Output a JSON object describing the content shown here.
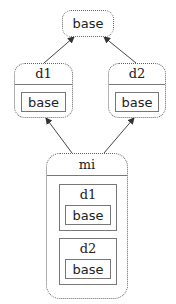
{
  "diagram": {
    "type": "class-hierarchy",
    "nodes": {
      "base": {
        "label": "base"
      },
      "d1": {
        "label": "d1",
        "contains": {
          "label": "base"
        }
      },
      "d2": {
        "label": "d2",
        "contains": {
          "label": "base"
        }
      },
      "mi": {
        "label": "mi",
        "contains": [
          {
            "label": "d1",
            "contains": {
              "label": "base"
            }
          },
          {
            "label": "d2",
            "contains": {
              "label": "base"
            }
          }
        ]
      }
    },
    "edges": [
      {
        "from": "d1",
        "to": "base"
      },
      {
        "from": "d2",
        "to": "base"
      },
      {
        "from": "mi",
        "to": "d1"
      },
      {
        "from": "mi",
        "to": "d2"
      }
    ]
  }
}
